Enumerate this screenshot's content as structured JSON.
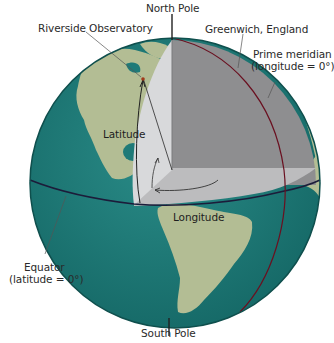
{
  "diagram": {
    "type": "cutaway-globe",
    "labels": {
      "north_pole": "North Pole",
      "south_pole": "South Pole",
      "observatory": "Riverside Observatory",
      "greenwich": "Greenwich, England",
      "prime_meridian_line1": "Prime meridian",
      "prime_meridian_line2": "(longitude = 0°)",
      "equator_line1": "Equator",
      "equator_line2": "(latitude = 0°)",
      "latitude": "Latitude",
      "longitude": "Longitude"
    },
    "colors": {
      "ocean": "#1f7a78",
      "land": "#b3bd94",
      "cutaway_face_dark": "#8e8e90",
      "cutaway_face_light": "#d8d9db",
      "cutaway_floor": "#bcbcbe",
      "equator_line": "#1c1c3a",
      "prime_meridian_line": "#6a1020",
      "leader_line": "#555555"
    }
  }
}
